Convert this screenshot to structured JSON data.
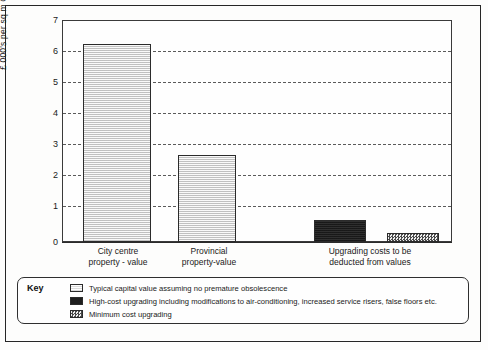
{
  "chart_data": {
    "type": "bar",
    "title": "",
    "xlabel": "",
    "ylabel": "£ 000's per sq m GIA",
    "ylim": [
      0,
      7
    ],
    "yticks": [
      0,
      1,
      2,
      3,
      4,
      5,
      6,
      7
    ],
    "ytick_labels": [
      "0",
      "1",
      "2",
      "3",
      "4",
      "5",
      "6",
      "7"
    ],
    "grid": true,
    "grid_style": "dashed-horizontal",
    "legend_position": "below-plot",
    "categories": [
      "City centre property - value",
      "Provincial property-value",
      "Upgrading costs to be deducted from values"
    ],
    "bars": [
      {
        "label": "City centre property - value",
        "series": "Typical capital value assuming no premature obsolescence",
        "value": 6.4,
        "fill": "light-hatch"
      },
      {
        "label": "Provincial property-value",
        "series": "Typical capital value assuming no premature obsolescence",
        "value": 2.8,
        "fill": "light-hatch"
      },
      {
        "label": "Upgrading costs to be deducted from values",
        "series": "High-cost upgrading including modifications to air-conditioning, increased service risers, false floors etc.",
        "value": 0.7,
        "fill": "solid-black"
      },
      {
        "label": "Upgrading costs to be deducted from values",
        "series": "Minimum cost upgrading",
        "value": 0.3,
        "fill": "checkered"
      }
    ]
  },
  "axis": {
    "y_title": "£ 000's per sq m GIA",
    "tick_labels": [
      "7",
      "6",
      "5",
      "4",
      "3",
      "2",
      "1",
      "0"
    ]
  },
  "categories": [
    {
      "line1": "City centre",
      "line2": "property - value"
    },
    {
      "line1": "Provincial",
      "line2": "property-value"
    },
    {
      "line1": "Upgrading costs to be",
      "line2": "deducted from values"
    }
  ],
  "legend": {
    "title": "Key",
    "items": [
      {
        "swatch": "light-hatch",
        "label": "Typical capital value assuming no premature obsolescence"
      },
      {
        "swatch": "solid-black",
        "label": "High-cost upgrading including modifications to air-conditioning, increased service risers, false floors etc."
      },
      {
        "swatch": "checkered",
        "label": "Minimum cost upgrading"
      }
    ]
  },
  "colors": {
    "ink": "#1a1a1a",
    "frame": "#2b2b2b",
    "grid": "#5a5a5a",
    "bar_light": "#dcdcdc",
    "bar_dark": "#232323",
    "bar_check": "#4a4a4a",
    "page": "#fdfdfc"
  }
}
